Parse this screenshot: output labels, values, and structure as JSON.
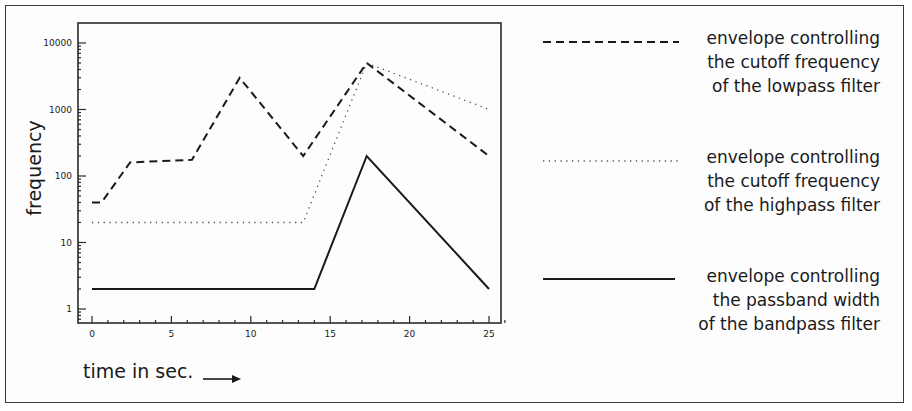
{
  "chart_data": {
    "type": "line",
    "title": "",
    "xlabel": "time in sec.",
    "ylabel": "frequency",
    "xlim": [
      -1,
      26.5
    ],
    "ylim": [
      0.6,
      20000
    ],
    "yscale": "log",
    "x_ticks": [
      0,
      5,
      10,
      15,
      20,
      25
    ],
    "x_tick_labels": [
      "0",
      "5",
      "10",
      "15",
      "20",
      "25"
    ],
    "y_ticks": [
      1,
      10,
      100,
      1000,
      10000
    ],
    "y_tick_labels": [
      "1",
      "10",
      "100",
      "1000",
      "10000"
    ],
    "grid": false,
    "legend_position": "right",
    "series": [
      {
        "name": "envelope controlling the cutoff frequency of the lowpass filter",
        "style": "dashed",
        "x": [
          0,
          0.6,
          2.4,
          6.3,
          9.3,
          13.3,
          17.3,
          25
        ],
        "y": [
          40,
          40,
          160,
          175,
          3000,
          200,
          5000,
          200
        ]
      },
      {
        "name": "envelope controlling the cutoff frequency of the highpass filter",
        "style": "dotted",
        "x": [
          0,
          13.3,
          17.3,
          25
        ],
        "y": [
          20,
          20,
          5000,
          1000
        ]
      },
      {
        "name": "envelope controlling the passband width of the bandpass filter",
        "style": "solid",
        "x": [
          0,
          14,
          17.3,
          25
        ],
        "y": [
          2,
          2,
          200,
          2
        ]
      }
    ]
  },
  "axes": {
    "xlabel": "time in sec.",
    "ylabel": "frequency",
    "x_tick_labels": [
      "0",
      "5",
      "10",
      "15",
      "20",
      "25"
    ],
    "y_tick_labels": [
      "1",
      "10",
      "100",
      "1000",
      "10000"
    ]
  },
  "legend": [
    {
      "style": "dashed",
      "lines": [
        "envelope controlling",
        "the cutoff frequency",
        "of the lowpass filter"
      ]
    },
    {
      "style": "dotted",
      "lines": [
        "envelope controlling",
        "the cutoff frequency",
        "of the highpass filter"
      ]
    },
    {
      "style": "solid",
      "lines": [
        "envelope controlling",
        "the passband width",
        "of the bandpass filter"
      ]
    }
  ],
  "colors": {
    "line": "#1a1a1a",
    "dotted": "#555555",
    "frame": "#3a3a3a"
  }
}
